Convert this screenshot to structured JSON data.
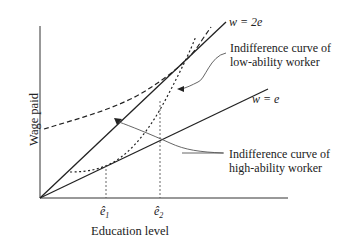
{
  "diagram": {
    "type": "economics-signaling",
    "axes": {
      "xlabel": "Education level",
      "ylabel": "Wage paid"
    },
    "lines": [
      {
        "id": "w2e",
        "label": "w = 2e",
        "slope": 2
      },
      {
        "id": "we",
        "label": "w = e",
        "slope": 1
      }
    ],
    "ticks": [
      {
        "id": "e1",
        "base": "ê",
        "sub": "1"
      },
      {
        "id": "e2",
        "base": "ê",
        "sub": "2"
      }
    ],
    "annotations": {
      "low": [
        "Indifference curve of",
        "low-ability worker"
      ],
      "high": [
        "Indifference curve of",
        "high-ability worker"
      ]
    },
    "colors": {
      "ink": "#222222",
      "leader": "#555555"
    }
  }
}
